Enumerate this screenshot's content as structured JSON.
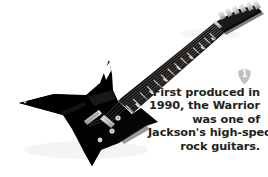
{
  "colors": {
    "background": "#ffffff",
    "guitar_body": "#000000",
    "guitar_hardware": "#d8d8d8",
    "fretboard": "#1a1a1a",
    "text": "#231f20",
    "badge_fill": "#bfbfbf",
    "badge_text": "#ffffff"
  },
  "photo": {
    "subject_name": "jackson-warrior-electric-guitar",
    "alt_text": "Black Jackson Warrior electric guitar angled from lower-left body to upper-right headstock"
  },
  "badge": {
    "icon_name": "guitar-pick-badge",
    "number": "1"
  },
  "caption": {
    "full_text": "First produced in 1990, the Warrior was one of Jackson's high-spec rock guitars.",
    "lines": [
      "First produced in",
      "1990, the Warrior",
      "was one of",
      "Jackson's high-spec",
      "rock guitars."
    ]
  }
}
